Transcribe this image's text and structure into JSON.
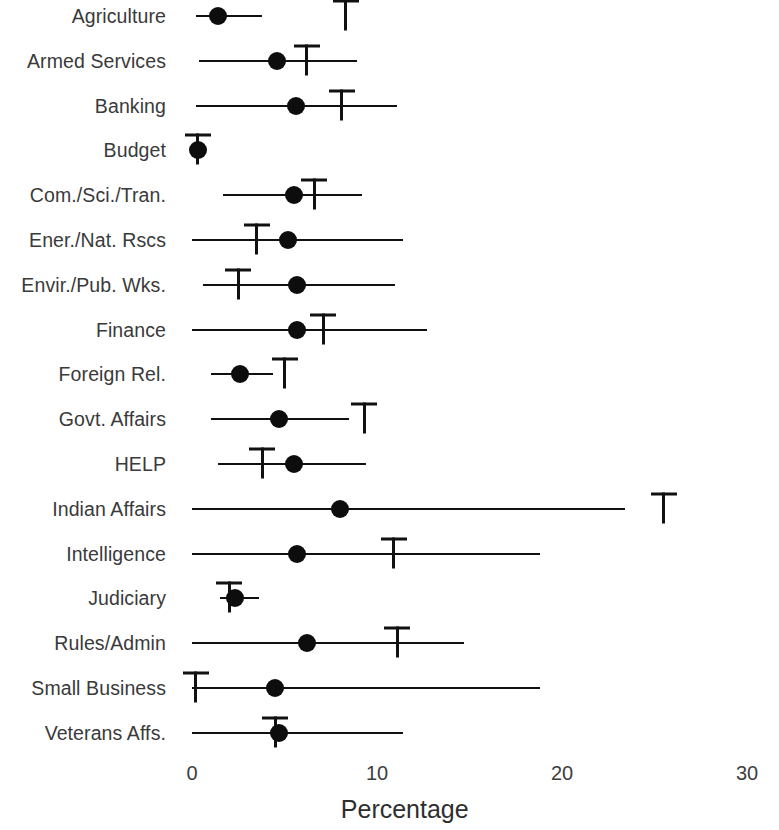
{
  "chart_data": {
    "type": "scatter",
    "title": "",
    "xlabel": "Percentage",
    "ylabel": "",
    "xlim": [
      0,
      30
    ],
    "xticks": [
      0,
      10,
      20,
      30
    ],
    "xtick_labels": [
      "0",
      "10",
      "20",
      "30"
    ],
    "grid": false,
    "legend": null,
    "orientation": "horizontal",
    "marker_note": "filled circle = point estimate; horizontal line = interval range; T-shaped marker = separate reference value",
    "categories": [
      "Agriculture",
      "Armed Services",
      "Banking",
      "Budget",
      "Com./Sci./Tran.",
      "Ener./Nat. Rscs",
      "Envir./Pub. Wks.",
      "Finance",
      "Foreign Rel.",
      "Govt. Affairs",
      "HELP",
      "Indian Affairs",
      "Intelligence",
      "Judiciary",
      "Rules/Admin",
      "Small Business",
      "Veterans Affs."
    ],
    "series": [
      {
        "name": "Point estimate (dot)",
        "values": [
          1.4,
          4.6,
          5.6,
          0.3,
          5.5,
          5.2,
          5.7,
          5.7,
          2.6,
          4.7,
          5.5,
          8.0,
          5.7,
          2.3,
          6.2,
          4.5,
          4.7
        ]
      },
      {
        "name": "Interval lower bound",
        "values": [
          0.2,
          0.4,
          0.2,
          0.0,
          1.7,
          0.0,
          0.6,
          0.0,
          1.0,
          1.0,
          1.4,
          0.0,
          0.0,
          1.5,
          0.0,
          0.0,
          0.0
        ]
      },
      {
        "name": "Interval upper bound",
        "values": [
          3.8,
          8.9,
          11.1,
          0.7,
          9.2,
          11.4,
          11.0,
          12.7,
          4.4,
          8.5,
          9.4,
          23.4,
          18.8,
          3.6,
          14.7,
          18.8,
          11.4
        ]
      },
      {
        "name": "Reference value (T marker)",
        "values": [
          8.3,
          6.2,
          8.1,
          0.3,
          6.6,
          3.5,
          2.5,
          7.1,
          5.0,
          9.3,
          3.8,
          25.5,
          10.9,
          2.0,
          11.1,
          0.2,
          4.5
        ]
      }
    ]
  }
}
